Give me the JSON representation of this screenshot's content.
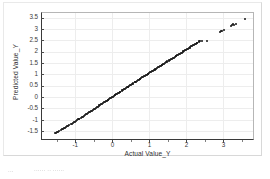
{
  "document": {
    "caption_fragment_left": "···",
    "caption_fragment_right": "······ ·· ······"
  },
  "chart_data": {
    "type": "scatter",
    "title": "",
    "xlabel": "Actual Value_Y",
    "ylabel": "Predicted Value_Y",
    "xlim": [
      -1.9,
      3.8
    ],
    "ylim": [
      -1.85,
      3.7
    ],
    "xticks": [
      -1,
      0,
      1,
      2,
      3
    ],
    "xtick_labels": [
      "-1",
      "0",
      "1",
      "2",
      "3"
    ],
    "yticks": [
      -1.5,
      -1,
      -0.5,
      0,
      0.5,
      1,
      1.5,
      2,
      2.5,
      3,
      3.5
    ],
    "ytick_labels": [
      "-1.5",
      "-1",
      "-0.5",
      "0",
      "0.5",
      "1",
      "1.5",
      "2",
      "2.5",
      "3",
      "3.5"
    ],
    "grid": true,
    "grid_color": "#ededed",
    "marker_color": "#141414",
    "marker_size": 2.0,
    "legend": null,
    "series": [
      {
        "name": "Predicted vs Actual",
        "points": [
          [
            -1.56,
            -1.6
          ],
          [
            -1.52,
            -1.57
          ],
          [
            -1.49,
            -1.55
          ],
          [
            -1.46,
            -1.52
          ],
          [
            -1.43,
            -1.49
          ],
          [
            -1.4,
            -1.46
          ],
          [
            -1.37,
            -1.43
          ],
          [
            -1.34,
            -1.4
          ],
          [
            -1.31,
            -1.37
          ],
          [
            -1.28,
            -1.35
          ],
          [
            -1.25,
            -1.32
          ],
          [
            -1.22,
            -1.29
          ],
          [
            -1.19,
            -1.26
          ],
          [
            -1.16,
            -1.23
          ],
          [
            -1.13,
            -1.2
          ],
          [
            -1.1,
            -1.17
          ],
          [
            -1.07,
            -1.14
          ],
          [
            -1.04,
            -1.11
          ],
          [
            -1.01,
            -1.08
          ],
          [
            -0.98,
            -1.05
          ],
          [
            -0.95,
            -1.01
          ],
          [
            -0.93,
            -0.99
          ],
          [
            -0.91,
            -0.97
          ],
          [
            -0.89,
            -0.95
          ],
          [
            -0.86,
            -0.92
          ],
          [
            -0.83,
            -0.89
          ],
          [
            -0.8,
            -0.86
          ],
          [
            -0.77,
            -0.83
          ],
          [
            -0.74,
            -0.8
          ],
          [
            -0.71,
            -0.77
          ],
          [
            -0.68,
            -0.74
          ],
          [
            -0.66,
            -0.71
          ],
          [
            -0.63,
            -0.68
          ],
          [
            -0.6,
            -0.65
          ],
          [
            -0.58,
            -0.62
          ],
          [
            -0.55,
            -0.6
          ],
          [
            -0.52,
            -0.57
          ],
          [
            -0.5,
            -0.54
          ],
          [
            -0.47,
            -0.51
          ],
          [
            -0.45,
            -0.48
          ],
          [
            -0.42,
            -0.45
          ],
          [
            -0.4,
            -0.43
          ],
          [
            -0.37,
            -0.4
          ],
          [
            -0.35,
            -0.37
          ],
          [
            -0.32,
            -0.34
          ],
          [
            -0.3,
            -0.32
          ],
          [
            -0.27,
            -0.29
          ],
          [
            -0.25,
            -0.26
          ],
          [
            -0.22,
            -0.24
          ],
          [
            -0.2,
            -0.21
          ],
          [
            -0.18,
            -0.19
          ],
          [
            -0.15,
            -0.16
          ],
          [
            -0.13,
            -0.13
          ],
          [
            -0.11,
            -0.11
          ],
          [
            -0.08,
            -0.08
          ],
          [
            -0.06,
            -0.06
          ],
          [
            -0.04,
            -0.03
          ],
          [
            -0.01,
            -0.01
          ],
          [
            0.01,
            0.02
          ],
          [
            0.04,
            0.04
          ],
          [
            0.06,
            0.07
          ],
          [
            0.08,
            0.09
          ],
          [
            0.11,
            0.12
          ],
          [
            0.13,
            0.14
          ],
          [
            0.15,
            0.17
          ],
          [
            0.18,
            0.19
          ],
          [
            0.2,
            0.22
          ],
          [
            0.22,
            0.24
          ],
          [
            0.25,
            0.27
          ],
          [
            0.27,
            0.29
          ],
          [
            0.29,
            0.32
          ],
          [
            0.32,
            0.34
          ],
          [
            0.34,
            0.37
          ],
          [
            0.36,
            0.39
          ],
          [
            0.39,
            0.42
          ],
          [
            0.41,
            0.44
          ],
          [
            0.43,
            0.46
          ],
          [
            0.46,
            0.49
          ],
          [
            0.48,
            0.51
          ],
          [
            0.5,
            0.54
          ],
          [
            0.53,
            0.56
          ],
          [
            0.55,
            0.59
          ],
          [
            0.57,
            0.61
          ],
          [
            0.6,
            0.64
          ],
          [
            0.62,
            0.66
          ],
          [
            0.64,
            0.68
          ],
          [
            0.67,
            0.71
          ],
          [
            0.69,
            0.73
          ],
          [
            0.71,
            0.76
          ],
          [
            0.74,
            0.78
          ],
          [
            0.76,
            0.81
          ],
          [
            0.78,
            0.83
          ],
          [
            0.81,
            0.86
          ],
          [
            0.83,
            0.88
          ],
          [
            0.86,
            0.91
          ],
          [
            0.88,
            0.93
          ],
          [
            0.9,
            0.95
          ],
          [
            0.93,
            0.98
          ],
          [
            0.95,
            1.0
          ],
          [
            0.97,
            1.03
          ],
          [
            1.0,
            1.05
          ],
          [
            1.02,
            1.08
          ],
          [
            1.05,
            1.1
          ],
          [
            1.07,
            1.13
          ],
          [
            1.09,
            1.15
          ],
          [
            1.12,
            1.18
          ],
          [
            1.14,
            1.2
          ],
          [
            1.16,
            1.22
          ],
          [
            1.19,
            1.25
          ],
          [
            1.21,
            1.27
          ],
          [
            1.23,
            1.3
          ],
          [
            1.26,
            1.32
          ],
          [
            1.28,
            1.35
          ],
          [
            1.31,
            1.37
          ],
          [
            1.33,
            1.4
          ],
          [
            1.35,
            1.42
          ],
          [
            1.38,
            1.45
          ],
          [
            1.4,
            1.47
          ],
          [
            1.42,
            1.49
          ],
          [
            1.45,
            1.52
          ],
          [
            1.47,
            1.54
          ],
          [
            1.49,
            1.57
          ],
          [
            1.52,
            1.59
          ],
          [
            1.54,
            1.62
          ],
          [
            1.57,
            1.64
          ],
          [
            1.59,
            1.67
          ],
          [
            1.61,
            1.69
          ],
          [
            1.64,
            1.72
          ],
          [
            1.66,
            1.74
          ],
          [
            1.68,
            1.76
          ],
          [
            1.71,
            1.79
          ],
          [
            1.73,
            1.81
          ],
          [
            1.76,
            1.84
          ],
          [
            1.78,
            1.86
          ],
          [
            1.8,
            1.89
          ],
          [
            1.83,
            1.91
          ],
          [
            1.85,
            1.94
          ],
          [
            1.87,
            1.96
          ],
          [
            1.9,
            1.99
          ],
          [
            1.92,
            2.01
          ],
          [
            1.94,
            2.03
          ],
          [
            1.97,
            2.06
          ],
          [
            1.99,
            2.08
          ],
          [
            2.02,
            2.11
          ],
          [
            2.04,
            2.13
          ],
          [
            2.06,
            2.16
          ],
          [
            2.09,
            2.18
          ],
          [
            2.11,
            2.21
          ],
          [
            2.13,
            2.23
          ],
          [
            2.16,
            2.26
          ],
          [
            2.18,
            2.28
          ],
          [
            2.21,
            2.3
          ],
          [
            2.23,
            2.33
          ],
          [
            2.25,
            2.35
          ],
          [
            2.28,
            2.38
          ],
          [
            2.3,
            2.4
          ],
          [
            2.33,
            2.43
          ],
          [
            2.35,
            2.45
          ],
          [
            2.38,
            2.47
          ],
          [
            2.41,
            2.48
          ],
          [
            2.57,
            2.48
          ],
          [
            2.9,
            2.88
          ],
          [
            2.93,
            2.9
          ],
          [
            2.96,
            2.92
          ],
          [
            3.02,
            2.94
          ],
          [
            3.2,
            3.12
          ],
          [
            3.23,
            3.16
          ],
          [
            3.26,
            3.2
          ],
          [
            3.29,
            3.17
          ],
          [
            3.33,
            3.22
          ],
          [
            3.58,
            3.42
          ]
        ]
      }
    ]
  }
}
